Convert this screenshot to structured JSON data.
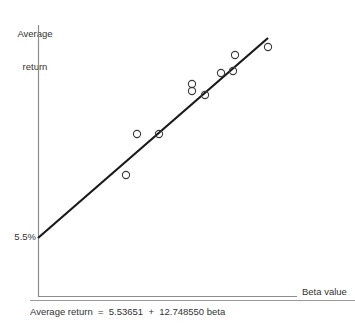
{
  "chart_data": {
    "type": "scatter",
    "title": "",
    "xlabel": "Beta value",
    "ylabel": "Average return",
    "ylabel_line1": "Average",
    "ylabel_line2": "return",
    "yticks": [
      "5.5%"
    ],
    "xticks": [],
    "grid": false,
    "legend": false,
    "annotation": "Average return  =  5.53651  +  12.748550 beta",
    "equation": {
      "text": "Average return  =  5.53651  +  12.748550 beta",
      "dependent": "Average return",
      "intercept": 5.53651,
      "slope": 12.74855,
      "independent": "beta"
    },
    "intercept_label": "5.5%",
    "series": [
      {
        "name": "Average return vs beta",
        "marker": "open-circle",
        "points_px": [
          {
            "x": 126,
            "y": 175
          },
          {
            "x": 137,
            "y": 134
          },
          {
            "x": 159,
            "y": 134
          },
          {
            "x": 192,
            "y": 84
          },
          {
            "x": 192,
            "y": 91
          },
          {
            "x": 205,
            "y": 95
          },
          {
            "x": 221,
            "y": 73
          },
          {
            "x": 233,
            "y": 71
          },
          {
            "x": 235,
            "y": 55
          },
          {
            "x": 268,
            "y": 47
          }
        ]
      }
    ],
    "fit_line_px": {
      "x1": 38,
      "y1": 238,
      "x2": 268,
      "y2": 38
    },
    "axes_px": {
      "x_origin": 38,
      "y_bottom": 297,
      "x_right": 297,
      "y_top": 25
    }
  },
  "figure": {
    "ylabel_line1": "Average",
    "ylabel_line2": "return",
    "xlabel": "Beta value",
    "ytick": "5.5%",
    "caption": "Average return  =  5.53651  +  12.748550 beta"
  },
  "colors": {
    "line": "#1a1a1a",
    "marker_stroke": "#3a3a3a",
    "axis": "#8d8d8d",
    "text": "#333333",
    "background": "#ffffff"
  }
}
